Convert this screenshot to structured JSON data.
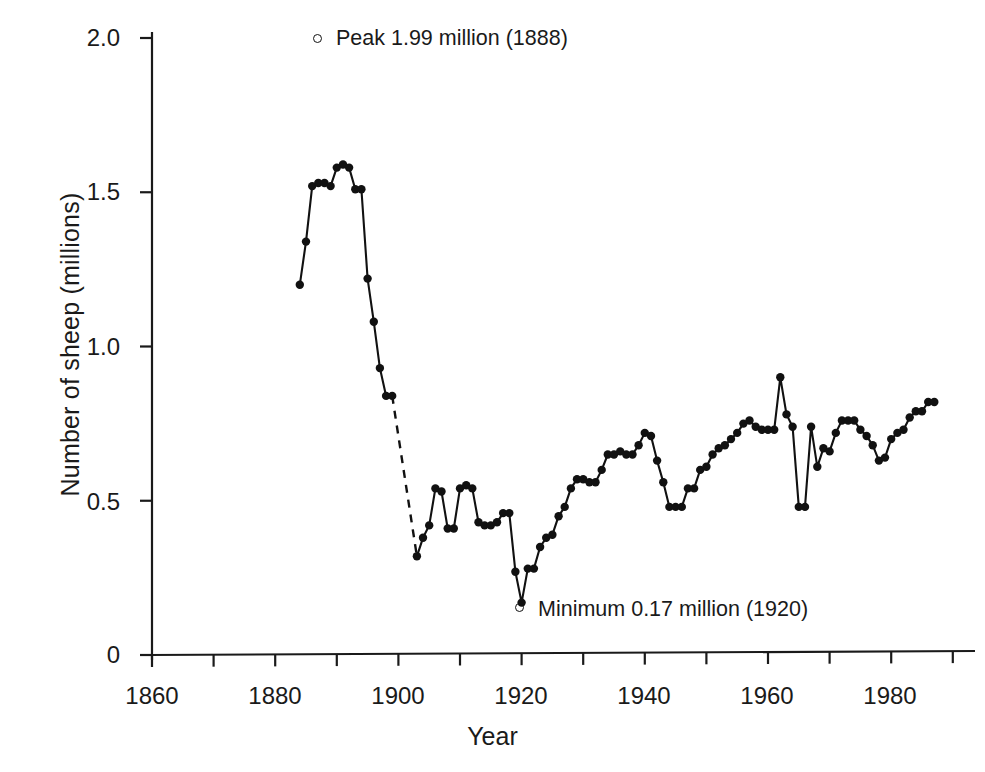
{
  "chart_data": {
    "type": "line",
    "title": "",
    "xlabel": "Year",
    "ylabel": "Number of sheep  (millions)",
    "xlim": [
      1856,
      1992
    ],
    "ylim": [
      0,
      2.05
    ],
    "grid": false,
    "legend_position": "none",
    "x_ticks_major": [
      1860,
      1880,
      1900,
      1920,
      1940,
      1960,
      1980
    ],
    "x_tick_labels": [
      "1860",
      "1880",
      "1900",
      "1920",
      "1940",
      "1960",
      "1980"
    ],
    "x_ticks_minor": [
      1870,
      1890,
      1910,
      1930,
      1950,
      1970,
      1990
    ],
    "y_ticks": [
      0,
      0.5,
      1.0,
      1.5,
      2.0
    ],
    "y_tick_labels": [
      "0",
      "0.5",
      "1.0",
      "1.5",
      "2.0"
    ],
    "series": [
      {
        "name": "Number of sheep (millions)",
        "marker": "filled-circle",
        "line_style": "solid-with-dashed-gap",
        "dashed_gap": [
          1899,
          1903
        ],
        "x": [
          1884,
          1885,
          1886,
          1887,
          1888,
          1889,
          1890,
          1891,
          1892,
          1893,
          1894,
          1895,
          1896,
          1897,
          1898,
          1899,
          1903,
          1904,
          1905,
          1906,
          1907,
          1908,
          1909,
          1910,
          1911,
          1912,
          1913,
          1914,
          1915,
          1916,
          1917,
          1918,
          1919,
          1920,
          1921,
          1922,
          1923,
          1924,
          1925,
          1926,
          1927,
          1928,
          1929,
          1930,
          1931,
          1932,
          1933,
          1934,
          1935,
          1936,
          1937,
          1938,
          1939,
          1940,
          1941,
          1942,
          1943,
          1944,
          1945,
          1946,
          1947,
          1948,
          1949,
          1950,
          1951,
          1952,
          1953,
          1954,
          1955,
          1956,
          1957,
          1958,
          1959,
          1960,
          1961,
          1962,
          1963,
          1964,
          1965,
          1966,
          1967,
          1968,
          1969,
          1970,
          1971,
          1972,
          1973,
          1974,
          1975,
          1976,
          1977,
          1978,
          1979,
          1980,
          1981,
          1982,
          1983,
          1984,
          1985,
          1986,
          1987
        ],
        "y": [
          1.2,
          1.34,
          1.52,
          1.53,
          1.53,
          1.52,
          1.58,
          1.59,
          1.58,
          1.51,
          1.51,
          1.22,
          1.08,
          0.93,
          0.84,
          0.84,
          0.32,
          0.38,
          0.42,
          0.54,
          0.53,
          0.41,
          0.41,
          0.54,
          0.55,
          0.54,
          0.43,
          0.42,
          0.42,
          0.43,
          0.46,
          0.46,
          0.27,
          0.17,
          0.28,
          0.28,
          0.35,
          0.38,
          0.39,
          0.45,
          0.48,
          0.54,
          0.57,
          0.57,
          0.56,
          0.56,
          0.6,
          0.65,
          0.65,
          0.66,
          0.65,
          0.65,
          0.68,
          0.72,
          0.71,
          0.63,
          0.56,
          0.48,
          0.48,
          0.48,
          0.54,
          0.54,
          0.6,
          0.61,
          0.65,
          0.67,
          0.68,
          0.7,
          0.72,
          0.75,
          0.76,
          0.74,
          0.73,
          0.73,
          0.73,
          0.9,
          0.78,
          0.74,
          0.48,
          0.48,
          0.74,
          0.61,
          0.67,
          0.66,
          0.72,
          0.76,
          0.76,
          0.76,
          0.73,
          0.71,
          0.68,
          0.63,
          0.64,
          0.7,
          0.72,
          0.73,
          0.77,
          0.79,
          0.79,
          0.82,
          0.82
        ]
      }
    ],
    "annotations": [
      {
        "id": "peak",
        "text": "Peak  1.99 million (1888)",
        "marker": "open-circle",
        "value": 1.99,
        "year": 1888
      },
      {
        "id": "minimum",
        "text": "Minimum  0.17 million (1920)",
        "marker": "open-circle",
        "value": 0.17,
        "year": 1920
      }
    ],
    "colors": {
      "line": "#111111",
      "marker": "#111111",
      "axis": "#1a1a1a",
      "background": "#ffffff"
    }
  }
}
